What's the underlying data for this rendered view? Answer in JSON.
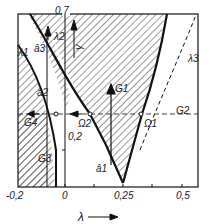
{
  "diagram": {
    "x_axis": {
      "label": "λ",
      "ticks": [
        "-0,2",
        "0",
        "0,25",
        "0,5"
      ]
    },
    "y_axis": {
      "label": "γ",
      "ticks": [
        "0,2",
        "0,7"
      ]
    },
    "curves": [
      "λ1",
      "λ2",
      "λ3"
    ],
    "vectors": [
      "G1",
      "G2",
      "G3",
      "G4"
    ],
    "points": [
      "Ω1",
      "Ω2",
      "Ω2"
    ],
    "arcs": [
      "â1",
      "â2",
      "â3"
    ],
    "colors": {
      "line": "#111111",
      "hatch": "#333333",
      "background": "#ffffff"
    }
  }
}
